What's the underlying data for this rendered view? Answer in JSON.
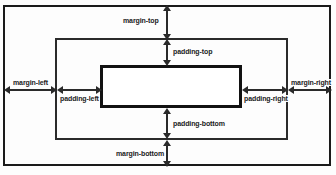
{
  "diagram": {
    "type": "box-model-diagram",
    "colors": {
      "background": "#fdfdfd",
      "line": "#2a2a2a",
      "margin_border": "#1a1a1a",
      "padding_border": "#2b2b2b",
      "content_border": "#121212",
      "label_text": "#1b1b1b"
    },
    "boxes": [
      {
        "name": "margin-box",
        "x": 3,
        "y": 5,
        "width": 328,
        "height": 161,
        "border_width": 2
      },
      {
        "name": "padding-box",
        "x": 55,
        "y": 38,
        "width": 233,
        "height": 102,
        "border_width": 2
      },
      {
        "name": "content-box",
        "x": 100,
        "y": 65,
        "width": 142,
        "height": 43,
        "border_width": 3
      }
    ],
    "labels": {
      "margin_top": "margin-top",
      "padding_top": "padding-top",
      "margin_left": "margin-left",
      "padding_left": "padding-left",
      "padding_right": "padding-right",
      "margin_right": "margin-right",
      "padding_bottom": "padding-bottom",
      "margin_bottom": "margin-bottom"
    },
    "measures": [
      {
        "name": "margin-top",
        "orientation": "vertical",
        "from": 6,
        "to": 39,
        "axis": 167
      },
      {
        "name": "padding-top",
        "orientation": "vertical",
        "from": 39,
        "to": 66,
        "axis": 167
      },
      {
        "name": "padding-bottom",
        "orientation": "vertical",
        "from": 107,
        "to": 139,
        "axis": 167
      },
      {
        "name": "margin-bottom",
        "orientation": "vertical",
        "from": 139,
        "to": 165,
        "axis": 167
      },
      {
        "name": "margin-left",
        "orientation": "horizontal",
        "from": 4,
        "to": 56,
        "axis": 90
      },
      {
        "name": "padding-left",
        "orientation": "horizontal",
        "from": 56,
        "to": 101,
        "axis": 90
      },
      {
        "name": "padding-right",
        "orientation": "horizontal",
        "from": 241,
        "to": 287,
        "axis": 90
      },
      {
        "name": "margin-right",
        "orientation": "horizontal",
        "from": 287,
        "to": 330,
        "axis": 90
      }
    ]
  }
}
